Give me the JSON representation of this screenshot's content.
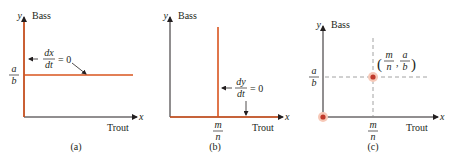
{
  "colors": {
    "axis": "#231f20",
    "nullcline": "#d9541e",
    "dashed": "#8a8a8a",
    "point_fill": "#c0392b",
    "point_halo": "#f7c9b8"
  },
  "panels": [
    {
      "id": "a",
      "caption": "(a)",
      "y_axis_var": "y",
      "y_axis_label": "Bass",
      "x_axis_var": "x",
      "x_axis_label": "Trout",
      "y_tick": {
        "num": "a",
        "den": "b"
      },
      "annotation": {
        "num": "dx",
        "den": "dt",
        "rhs": "= 0",
        "arrow": "←"
      }
    },
    {
      "id": "b",
      "caption": "(b)",
      "y_axis_var": "y",
      "y_axis_label": "Bass",
      "x_axis_var": "x",
      "x_axis_label": "Trout",
      "x_tick": {
        "num": "m",
        "den": "n"
      },
      "annotation": {
        "num": "dy",
        "den": "dt",
        "rhs": "= 0",
        "arrow": "←"
      }
    },
    {
      "id": "c",
      "caption": "(c)",
      "y_axis_var": "y",
      "y_axis_label": "Bass",
      "x_axis_var": "x",
      "x_axis_label": "Trout",
      "y_tick": {
        "num": "a",
        "den": "b"
      },
      "x_tick": {
        "num": "m",
        "den": "n"
      },
      "point_label": {
        "open": "(",
        "x_num": "m",
        "x_den": "n",
        "sep": ",",
        "y_num": "a",
        "y_den": "b",
        "close": ")"
      }
    }
  ]
}
